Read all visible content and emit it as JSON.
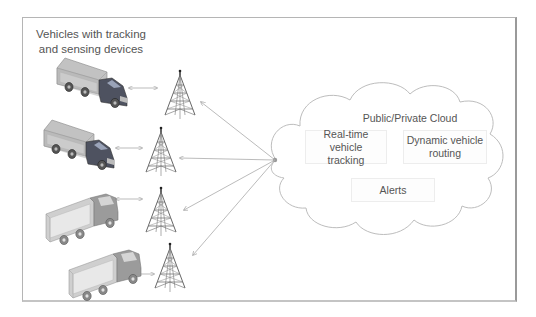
{
  "diagram": {
    "title_line1": "Vehicles with tracking",
    "title_line2": "and sensing devices",
    "cloud": {
      "label": "Public/Private Cloud",
      "services": [
        {
          "line1": "Real-time vehicle",
          "line2": "tracking"
        },
        {
          "line1": "Dynamic vehicle",
          "line2": "routing"
        },
        {
          "line1": "Alerts",
          "line2": ""
        }
      ]
    },
    "vehicles": [
      {
        "name": "truck-1",
        "style": "box-truck-dark-cab"
      },
      {
        "name": "truck-2",
        "style": "box-truck-dark-cab"
      },
      {
        "name": "truck-3",
        "style": "box-truck-light"
      },
      {
        "name": "truck-4",
        "style": "box-truck-light"
      }
    ],
    "towers": [
      "cell-tower-1",
      "cell-tower-2",
      "cell-tower-3",
      "cell-tower-4"
    ],
    "colors": {
      "line": "#a9a9a9",
      "text": "#555555",
      "border": "#b5b5b5",
      "truck_body": "#bdbdbd",
      "truck_cab_dark": "#4a4d57"
    }
  }
}
